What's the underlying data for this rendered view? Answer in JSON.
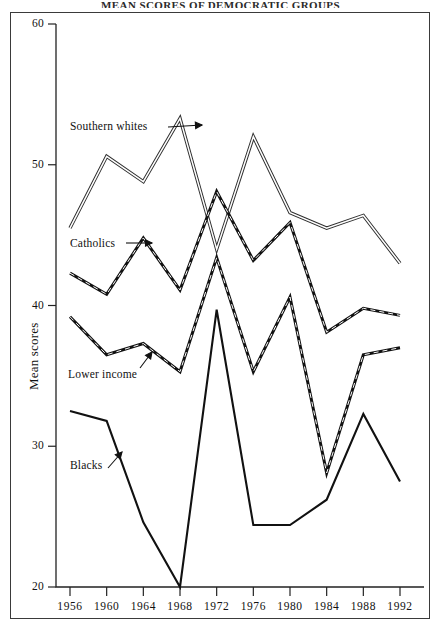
{
  "figure": {
    "clipped_top_title": "MEAN SCORES OF DEMOCRATIC GROUPS",
    "ylabel": "Mean scores"
  },
  "axes": {
    "y_ticks": [
      "20",
      "30",
      "40",
      "50",
      "60"
    ],
    "x_ticks": [
      "1956",
      "1960",
      "1964",
      "1968",
      "1972",
      "1976",
      "1980",
      "1984",
      "1988",
      "1992"
    ]
  },
  "annotations": {
    "southern_whites": "Southern whites",
    "catholics": "Catholics",
    "lower_income": "Lower income",
    "blacks": "Blacks"
  },
  "chart_data": {
    "type": "line",
    "title": "",
    "xlabel": "",
    "ylabel": "Mean scores",
    "x": [
      1956,
      1960,
      1964,
      1968,
      1972,
      1976,
      1980,
      1984,
      1988,
      1992
    ],
    "categories": [
      "1956",
      "1960",
      "1964",
      "1968",
      "1972",
      "1976",
      "1980",
      "1984",
      "1988",
      "1992"
    ],
    "xlim": [
      1954,
      1994
    ],
    "ylim": [
      20,
      60
    ],
    "grid": false,
    "legend": "inline-annotations",
    "series": [
      {
        "name": "Southern whites",
        "style": "double-line",
        "values": [
          45.5,
          50.6,
          48.8,
          53.3,
          44.0,
          52.0,
          46.6,
          45.5,
          46.4,
          43.0
        ]
      },
      {
        "name": "Catholics",
        "style": "dash-dot",
        "values": [
          42.3,
          40.8,
          44.8,
          41.1,
          48.1,
          43.2,
          45.9,
          38.1,
          39.8,
          39.3
        ]
      },
      {
        "name": "Lower income",
        "style": "dash-dot",
        "values": [
          39.2,
          36.5,
          37.3,
          35.3,
          43.4,
          35.3,
          40.6,
          28.1,
          36.5,
          37.0
        ]
      },
      {
        "name": "Blacks",
        "style": "solid",
        "values": [
          32.5,
          31.8,
          24.6,
          20.0,
          39.7,
          24.4,
          24.4,
          26.2,
          32.3,
          27.5
        ]
      }
    ]
  }
}
